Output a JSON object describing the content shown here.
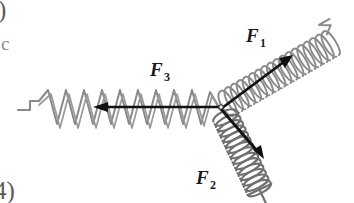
{
  "figure": {
    "background_color": "#ffffff",
    "width": 354,
    "height": 203,
    "junction": {
      "x": 221,
      "y": 107
    },
    "labels": {
      "f1_base": "F",
      "f1_sub": "1",
      "f2_base": "F",
      "f2_sub": "2",
      "f3_base": "F",
      "f3_sub": "3"
    },
    "label_positions": {
      "f1": {
        "x": 246,
        "y": 42
      },
      "f2": {
        "x": 196,
        "y": 184
      },
      "f3": {
        "x": 150,
        "y": 76
      }
    },
    "colors": {
      "arrow": "#111111",
      "spring_light": "#8a8a8a",
      "spring_dark": "#6b6b6b",
      "spring_f2": "#707070",
      "label_text": "#1a1a1a",
      "margin_text": "#5a5a5a"
    },
    "springs": [
      {
        "name": "spring-f1",
        "style": "helix",
        "angle_deg": -30,
        "start": {
          "x": 228,
          "y": 104
        },
        "end": {
          "x": 335,
          "y": 40
        },
        "coils": 18,
        "amplitude": 15,
        "stroke": "#8a8a8a",
        "hook": "end"
      },
      {
        "name": "spring-f2",
        "style": "helix",
        "angle_deg": 65,
        "start": {
          "x": 226,
          "y": 116
        },
        "end": {
          "x": 290,
          "y": 180
        },
        "coils": 15,
        "amplitude": 14,
        "stroke": "#707070",
        "hook": "end"
      },
      {
        "name": "spring-f3",
        "style": "zigzag",
        "angle_deg": 180,
        "start": {
          "x": 217,
          "y": 107
        },
        "end": {
          "x": 38,
          "y": 107
        },
        "coils": 10,
        "amplitude": 18,
        "stroke": "#8a8a8a",
        "hook": "end"
      }
    ],
    "force_arrows": [
      {
        "name": "arrow-f1",
        "label": "F1",
        "tail": {
          "x": 223,
          "y": 108
        },
        "tip": {
          "x": 292,
          "y": 56
        },
        "direction": "up-right"
      },
      {
        "name": "arrow-f2",
        "label": "F2",
        "tail": {
          "x": 222,
          "y": 110
        },
        "tip": {
          "x": 263,
          "y": 158
        },
        "direction": "down-right"
      },
      {
        "name": "arrow-f3",
        "label": "F3",
        "tail": {
          "x": 219,
          "y": 107
        },
        "tip": {
          "x": 95,
          "y": 107
        },
        "direction": "left"
      }
    ],
    "margin_marks": {
      "top_left": ")",
      "mid_left": "c",
      "bottom_left": "4)"
    }
  }
}
